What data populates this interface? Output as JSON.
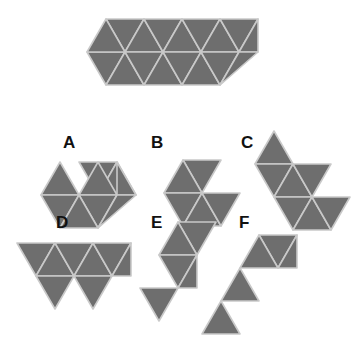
{
  "figure": {
    "background_color": "#ffffff",
    "fill_color": "#6e6e6e",
    "edge_color": "#c9c9c9",
    "edge_width": 1.6,
    "label_color": "#111111",
    "triangle_side": 38,
    "triangle_height": 32.9
  },
  "prompt_shape": {
    "name": "target-hexagon-strip",
    "description": "Elongated hexagon / triangle strip made of 12 unit triangles arranged in two rows of six",
    "triangle_count": 12,
    "rows": 2,
    "columns": 6,
    "polygons": [
      {
        "id": "p1",
        "points": "106,19 144,19 125,52"
      },
      {
        "id": "p2",
        "points": "144,19 163,52 125,52"
      },
      {
        "id": "p3",
        "points": "144,19 182,19 163,52"
      },
      {
        "id": "p4",
        "points": "182,19 201,52 163,52"
      },
      {
        "id": "p5",
        "points": "182,19 220,19 201,52"
      },
      {
        "id": "p6",
        "points": "220,19 239,52 201,52"
      },
      {
        "id": "p7",
        "points": "87,52 125,52 106,85"
      },
      {
        "id": "p8",
        "points": "125,52 144,85 106,85"
      },
      {
        "id": "p9",
        "points": "125,52 163,52 144,85"
      },
      {
        "id": "p10",
        "points": "163,52 182,85 144,85"
      },
      {
        "id": "p11",
        "points": "163,52 201,52 182,85"
      },
      {
        "id": "p12",
        "points": "201,52 220,85 182,85"
      },
      {
        "id": "p13",
        "points": "201,52 239,52 220,85"
      },
      {
        "id": "p14",
        "points": "239,52 258,19 220,19"
      },
      {
        "id": "p15",
        "points": "239,52 258,19 258,19"
      }
    ]
  },
  "options": [
    {
      "key": "A",
      "name": "option-a",
      "label": "A",
      "label_x": 63,
      "label_y": 148,
      "description": "Trapezoid of three triangles sitting left of a hexagon-like cluster; six unit triangles total",
      "triangle_count": 6,
      "polygons": [
        {
          "id": "a1",
          "points": "60,162 98,162 79,195"
        },
        {
          "id": "a2",
          "points": "98,162 117,195 79,195"
        },
        {
          "id": "a3",
          "points": "98,162 136,162 117,195"
        },
        {
          "id": "a4",
          "points": "41,195 79,195 60,162"
        },
        {
          "id": "a5",
          "points": "41,195 79,195 60,228"
        },
        {
          "id": "a6",
          "points": "79,195 117,195 98,228"
        },
        {
          "id": "a7",
          "points": "79,195 98,228 60,228"
        },
        {
          "id": "a8",
          "points": "117,195 136,162 98,162"
        }
      ]
    },
    {
      "key": "B",
      "name": "option-b",
      "label": "B",
      "label_x": 151,
      "label_y": 148,
      "description": "Zigzag strip: upper parallelogram of two triangles stepping down-right into a lower row of three triangles",
      "triangle_count": 6,
      "polygons": [
        {
          "id": "b1",
          "points": "183,160 221,160 202,193"
        },
        {
          "id": "b2",
          "points": "183,160 202,193 164,193"
        },
        {
          "id": "b3",
          "points": "164,193 202,193 183,226"
        },
        {
          "id": "b4",
          "points": "202,193 221,226 183,226"
        },
        {
          "id": "b5",
          "points": "202,193 240,193 221,226"
        },
        {
          "id": "b6",
          "points": "221,226 240,193 240,193"
        }
      ]
    },
    {
      "key": "C",
      "name": "option-c",
      "label": "C",
      "label_x": 241,
      "label_y": 148,
      "description": "Staircase cluster of triangles descending to the right over three diagonal steps",
      "triangle_count": 7,
      "polygons": [
        {
          "id": "c1",
          "points": "274,131 293,164 255,164"
        },
        {
          "id": "c2",
          "points": "255,164 293,164 274,197"
        },
        {
          "id": "c3",
          "points": "293,164 312,197 274,197"
        },
        {
          "id": "c4",
          "points": "293,164 331,164 312,197"
        },
        {
          "id": "c5",
          "points": "274,197 312,197 293,230"
        },
        {
          "id": "c6",
          "points": "312,197 331,230 293,230"
        },
        {
          "id": "c7",
          "points": "312,197 350,197 331,230"
        }
      ]
    },
    {
      "key": "D",
      "name": "option-d",
      "label": "D",
      "label_x": 56,
      "label_y": 228,
      "description": "Horizontal sawtooth strip: three upward triangles joined along a baseline with three downward triangles hanging below",
      "triangle_count": 6,
      "polygons": [
        {
          "id": "d1",
          "points": "17,243 55,243 36,276"
        },
        {
          "id": "d2",
          "points": "55,243 74,276 36,276"
        },
        {
          "id": "d3",
          "points": "74,243 112,243 93,276"
        },
        {
          "id": "d4",
          "points": "55,243 93,243 74,276"
        },
        {
          "id": "d5",
          "points": "93,243 131,243 112,276"
        },
        {
          "id": "d6",
          "points": "36,276 74,276 55,309"
        },
        {
          "id": "d7",
          "points": "74,276 112,276 93,309"
        },
        {
          "id": "d8",
          "points": "112,276 131,243 131,243"
        }
      ]
    },
    {
      "key": "E",
      "name": "option-e",
      "label": "E",
      "label_x": 151,
      "label_y": 228,
      "description": "Vertical zigzag chain of triangles with one separate downward triangle at lower left",
      "triangle_count": 6,
      "polygons": [
        {
          "id": "e1",
          "points": "178,222 197,255 159,255"
        },
        {
          "id": "e2",
          "points": "178,222 216,222 197,255"
        },
        {
          "id": "e3",
          "points": "159,255 197,255 178,288"
        },
        {
          "id": "e4",
          "points": "178,288 197,255 197,255"
        },
        {
          "id": "e5",
          "points": "140,288 178,288 159,321"
        }
      ]
    },
    {
      "key": "F",
      "name": "option-f",
      "label": "F",
      "label_x": 239,
      "label_y": 228,
      "description": "Diagonal staircase of four triangles, a wide top pair stepping down-left to two single triangles",
      "triangle_count": 5,
      "polygons": [
        {
          "id": "f1",
          "points": "259,235 297,235 278,268"
        },
        {
          "id": "f2",
          "points": "240,268 278,268 259,235"
        },
        {
          "id": "f3",
          "points": "278,268 297,235 297,235"
        },
        {
          "id": "f4",
          "points": "221,301 259,301 240,268"
        },
        {
          "id": "f5",
          "points": "202,334 240,334 221,301"
        }
      ]
    }
  ]
}
